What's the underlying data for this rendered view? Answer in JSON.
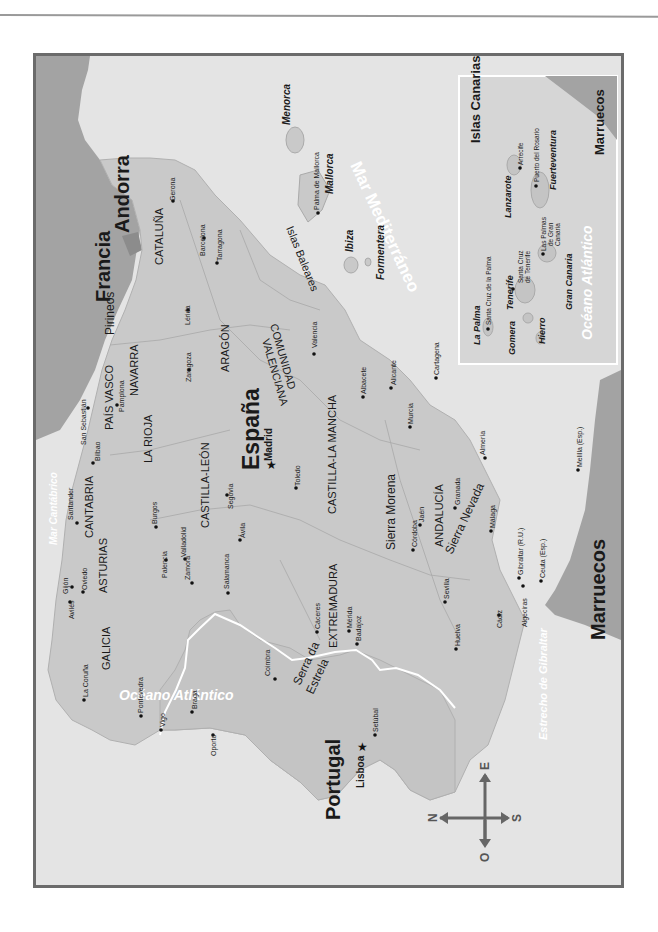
{
  "map": {
    "title": "España",
    "orientation": "rotated 90° clockwise (north points left)",
    "colors": {
      "sea": "#e4e4e4",
      "spain_land": "#c9c9c9",
      "foreign_land": "#a3a3a3",
      "frame_border": "#6b6b6b",
      "border_line": "#ffffff",
      "sea_label": "#ffffff"
    },
    "countries": [
      {
        "id": "espana",
        "label": "España"
      },
      {
        "id": "francia",
        "label": "Francia"
      },
      {
        "id": "andorra",
        "label": "Andorra"
      },
      {
        "id": "portugal",
        "label": "Portugal"
      },
      {
        "id": "marruecos",
        "label": "Marruecos"
      },
      {
        "id": "marruecos-inset",
        "label": "Marruecos"
      }
    ],
    "seas": [
      {
        "id": "mar-cantabrico",
        "label": "Mar Cantábrico"
      },
      {
        "id": "oceano-atlantico",
        "label": "Océano Atlántico"
      },
      {
        "id": "mar-mediterraneo",
        "label": "Mar Mediterráneo"
      },
      {
        "id": "estrecho-gibraltar",
        "label": "Estrecho de Gibraltar"
      },
      {
        "id": "oceano-atlantico-inset",
        "label": "Océano Atlántico"
      }
    ],
    "regions": [
      {
        "id": "galicia",
        "label": "GALICIA"
      },
      {
        "id": "asturias",
        "label": "ASTURIAS"
      },
      {
        "id": "cantabria",
        "label": "CANTABRIA"
      },
      {
        "id": "pais-vasco",
        "label": "PAÍS VASCO"
      },
      {
        "id": "navarra",
        "label": "NAVARRA"
      },
      {
        "id": "la-rioja",
        "label": "LA RIOJA"
      },
      {
        "id": "aragon",
        "label": "ARAGÓN"
      },
      {
        "id": "cataluna",
        "label": "CATALUÑA"
      },
      {
        "id": "castilla-leon",
        "label": "CASTILLA-LEÓN"
      },
      {
        "id": "castilla-la-mancha",
        "label": "CASTILLA-LA MANCHA"
      },
      {
        "id": "comunidad",
        "label": "COMUNIDAD"
      },
      {
        "id": "valenciana",
        "label": "VALENCIANA"
      },
      {
        "id": "extremadura",
        "label": "EXTREMADURA"
      },
      {
        "id": "andalucia",
        "label": "ANDALUCÍA"
      }
    ],
    "mountains": [
      {
        "id": "pirineos",
        "label": "Pirineos"
      },
      {
        "id": "sierra-morena",
        "label": "Sierra Morena"
      },
      {
        "id": "sierra-nevada",
        "label": "Sierra Nevada"
      },
      {
        "id": "serra-da",
        "label": "Serra da"
      },
      {
        "id": "estrela",
        "label": "Estrela"
      }
    ],
    "capitals": [
      {
        "id": "madrid",
        "label": "Madrid"
      },
      {
        "id": "lisboa",
        "label": "Lisboa"
      }
    ],
    "cities": [
      {
        "id": "la-coruna",
        "label": "La Coruña"
      },
      {
        "id": "pontevedra",
        "label": "Pontevedra"
      },
      {
        "id": "vigo",
        "label": "Vigo"
      },
      {
        "id": "aviles",
        "label": "Avilés"
      },
      {
        "id": "gijon",
        "label": "Gijón"
      },
      {
        "id": "oviedo",
        "label": "Oviedo"
      },
      {
        "id": "santander",
        "label": "Santander"
      },
      {
        "id": "bilbao",
        "label": "Bilbao"
      },
      {
        "id": "san-sebastian",
        "label": "San Sebastián"
      },
      {
        "id": "pamplona",
        "label": "Pamplona"
      },
      {
        "id": "burgos",
        "label": "Burgos"
      },
      {
        "id": "palencia",
        "label": "Palencia"
      },
      {
        "id": "valladolid",
        "label": "Valladolid"
      },
      {
        "id": "zamora",
        "label": "Zamora"
      },
      {
        "id": "salamanca",
        "label": "Salamanca"
      },
      {
        "id": "avila",
        "label": "Ávila"
      },
      {
        "id": "segovia",
        "label": "Segovia"
      },
      {
        "id": "toledo",
        "label": "Toledo"
      },
      {
        "id": "zaragoza",
        "label": "Zaragoza"
      },
      {
        "id": "lerida",
        "label": "Lérida"
      },
      {
        "id": "gerona",
        "label": "Gerona"
      },
      {
        "id": "barcelona",
        "label": "Barcelona"
      },
      {
        "id": "tarragona",
        "label": "Tarragona"
      },
      {
        "id": "valencia",
        "label": "Valencia"
      },
      {
        "id": "albacete",
        "label": "Albacete"
      },
      {
        "id": "alicante",
        "label": "Alicante"
      },
      {
        "id": "murcia",
        "label": "Murcia"
      },
      {
        "id": "cartagena",
        "label": "Cartagena"
      },
      {
        "id": "caceres",
        "label": "Cáceres"
      },
      {
        "id": "merida",
        "label": "Mérida"
      },
      {
        "id": "badajoz",
        "label": "Badajoz"
      },
      {
        "id": "cordoba",
        "label": "Córdoba"
      },
      {
        "id": "jaen",
        "label": "Jaén"
      },
      {
        "id": "granada",
        "label": "Granada"
      },
      {
        "id": "almeria",
        "label": "Almería"
      },
      {
        "id": "malaga",
        "label": "Málaga"
      },
      {
        "id": "sevilla",
        "label": "Sevilla"
      },
      {
        "id": "huelva",
        "label": "Huelva"
      },
      {
        "id": "cadiz",
        "label": "Cádiz"
      },
      {
        "id": "algeciras",
        "label": "Algeciras"
      },
      {
        "id": "gibraltar",
        "label": "Gibraltar (R.U.)"
      },
      {
        "id": "ceuta",
        "label": "Ceuta (Esp.)"
      },
      {
        "id": "melilla",
        "label": "Melilla (Esp.)"
      },
      {
        "id": "oporto",
        "label": "Oporto"
      },
      {
        "id": "braga",
        "label": "Braga"
      },
      {
        "id": "coimbra",
        "label": "Coimbra"
      },
      {
        "id": "setubal",
        "label": "Setúbal"
      }
    ],
    "baleares": {
      "group_label": "Islas Baleares",
      "islands": [
        {
          "id": "menorca",
          "label": "Menorca"
        },
        {
          "id": "mallorca",
          "label": "Mallorca"
        },
        {
          "id": "ibiza",
          "label": "Ibiza"
        },
        {
          "id": "formentera",
          "label": "Formentera"
        }
      ],
      "cities": [
        {
          "id": "palma",
          "label": "Palma de Mallorca"
        }
      ]
    },
    "inset": {
      "title": "Islas Canarias",
      "islands": [
        {
          "id": "la-palma",
          "label": "La Palma"
        },
        {
          "id": "gomera",
          "label": "Gomera"
        },
        {
          "id": "hierro",
          "label": "Hierro"
        },
        {
          "id": "tenerife",
          "label": "Tenerife"
        },
        {
          "id": "gran-canaria",
          "label": "Gran Canaria"
        },
        {
          "id": "lanzarote",
          "label": "Lanzarote"
        },
        {
          "id": "fuerteventura",
          "label": "Fuerteventura"
        }
      ],
      "cities": [
        {
          "id": "santa-cruz-palma",
          "label": "Santa Cruz de la Palma"
        },
        {
          "id": "santa-cruz-tenerife-1",
          "label": "Santa Cruz"
        },
        {
          "id": "santa-cruz-tenerife-2",
          "label": "de Tenerife"
        },
        {
          "id": "las-palmas-1",
          "label": "Las Palmas"
        },
        {
          "id": "las-palmas-2",
          "label": "de Gran"
        },
        {
          "id": "las-palmas-3",
          "label": "Canaria"
        },
        {
          "id": "arrecife",
          "label": "Arrecife"
        },
        {
          "id": "puerto-rosario",
          "label": "Puerto del Rosario"
        }
      ]
    },
    "compass": {
      "north": "N",
      "south": "S",
      "east": "E",
      "west": "O"
    }
  }
}
